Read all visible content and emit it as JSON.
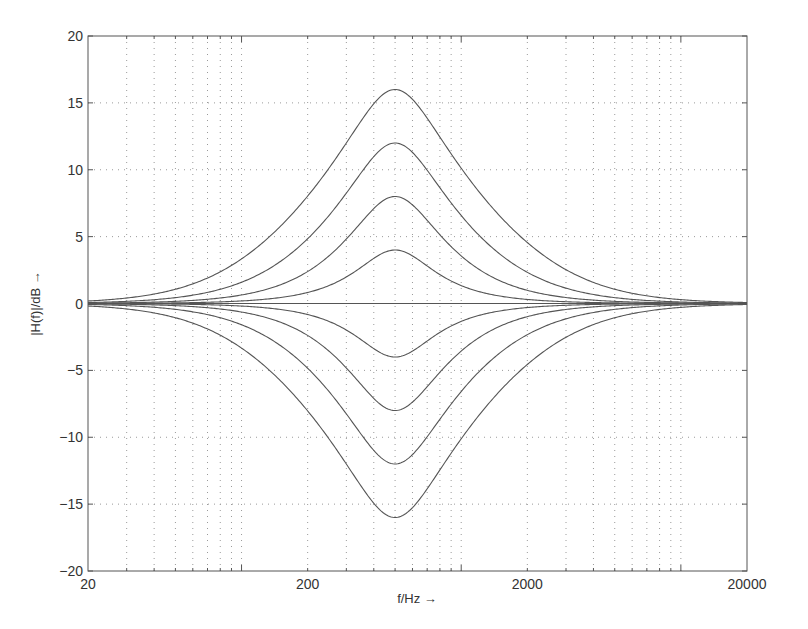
{
  "chart_data": {
    "type": "line",
    "title": "",
    "xlabel": "f/Hz →",
    "ylabel": "|H(f)|/dB →",
    "xscale": "log",
    "xlim": [
      20,
      20000
    ],
    "ylim": [
      -20,
      20
    ],
    "grid": true,
    "grid_style": "dotted",
    "legend": null,
    "x_tick_labels": [
      "20",
      "200",
      "2000",
      "20000"
    ],
    "x_ticks": [
      20,
      200,
      2000,
      20000
    ],
    "x_minor_grid": [
      30,
      40,
      50,
      60,
      70,
      80,
      90,
      100,
      300,
      400,
      500,
      600,
      700,
      800,
      900,
      1000,
      3000,
      4000,
      5000,
      6000,
      7000,
      8000,
      9000,
      10000
    ],
    "y_ticks": [
      -20,
      -15,
      -10,
      -5,
      0,
      5,
      10,
      15,
      20
    ],
    "y_tick_labels": [
      "−20",
      "−15",
      "−10",
      "−5",
      "0",
      "5",
      "10",
      "15",
      "20"
    ],
    "filter": {
      "kind": "peaking-eq",
      "center_frequency_hz": 500,
      "q": 1.19
    },
    "x": [
      20,
      50,
      100,
      200,
      300,
      400,
      500,
      700,
      1000,
      2000,
      5000,
      10000,
      20000
    ],
    "series": [
      {
        "name": "+16 dB",
        "gain_db": 16,
        "values": [
          0.19,
          1.06,
          3.32,
          8.0,
          11.99,
          14.93,
          16.0,
          13.85,
          10.1,
          4.54,
          1.06,
          0.29,
          0.07
        ]
      },
      {
        "name": "+12 dB",
        "gain_db": 12,
        "values": [
          0.07,
          0.44,
          1.58,
          4.83,
          8.24,
          10.98,
          12.0,
          9.95,
          6.56,
          2.32,
          0.44,
          0.11,
          0.03
        ]
      },
      {
        "name": "+8 dB",
        "gain_db": 8,
        "values": [
          0.03,
          0.16,
          0.63,
          2.38,
          4.81,
          7.09,
          8.0,
          6.21,
          3.55,
          0.98,
          0.16,
          0.04,
          0.01
        ]
      },
      {
        "name": "+4 dB",
        "gain_db": 4,
        "values": [
          0.01,
          0.05,
          0.19,
          0.82,
          1.98,
          3.37,
          4.0,
          2.8,
          1.33,
          0.3,
          0.05,
          0.01,
          0.0
        ]
      },
      {
        "name": "0 dB",
        "gain_db": 0,
        "values": [
          0,
          0,
          0,
          0,
          0,
          0,
          0,
          0,
          0,
          0,
          0,
          0,
          0
        ]
      },
      {
        "name": "-4 dB",
        "gain_db": -4,
        "values": [
          -0.01,
          -0.05,
          -0.19,
          -0.82,
          -1.98,
          -3.37,
          -4.0,
          -2.8,
          -1.33,
          -0.3,
          -0.05,
          -0.01,
          0.0
        ]
      },
      {
        "name": "-8 dB",
        "gain_db": -8,
        "values": [
          -0.03,
          -0.16,
          -0.63,
          -2.38,
          -4.81,
          -7.09,
          -8.0,
          -6.21,
          -3.55,
          -0.98,
          -0.16,
          -0.04,
          -0.01
        ]
      },
      {
        "name": "-12 dB",
        "gain_db": -12,
        "values": [
          -0.07,
          -0.44,
          -1.58,
          -4.83,
          -8.24,
          -10.98,
          -12.0,
          -9.95,
          -6.56,
          -2.32,
          -0.44,
          -0.11,
          -0.03
        ]
      },
      {
        "name": "-16 dB",
        "gain_db": -16,
        "values": [
          -0.19,
          -1.06,
          -3.32,
          -8.0,
          -11.99,
          -14.93,
          -16.0,
          -13.85,
          -10.1,
          -4.54,
          -1.06,
          -0.29,
          -0.07
        ]
      }
    ],
    "colors": {
      "axis": "#555555",
      "grid": "#9a9a9a",
      "curve": "#555555",
      "text": "#333333"
    }
  },
  "layout": {
    "plot_left": 88,
    "plot_top": 36,
    "plot_right": 747,
    "plot_bottom": 571
  }
}
